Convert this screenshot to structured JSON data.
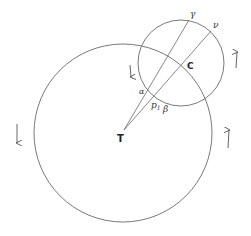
{
  "diagram": {
    "type": "geometric-figure",
    "colors": {
      "stroke": "#6a6a6a",
      "text": "#333333",
      "background": "#ffffff"
    },
    "circles": [
      {
        "name": "large-circle",
        "center_label": "T",
        "cx": 123,
        "cy": 133,
        "r": 89
      },
      {
        "name": "small-circle",
        "center_label": "C",
        "cx": 181,
        "cy": 63,
        "r": 43
      }
    ],
    "lines": [
      {
        "name": "line-T-gamma",
        "from": "T",
        "to": "γ"
      },
      {
        "name": "line-T-nu",
        "from": "T",
        "to": "ν"
      }
    ],
    "labels": {
      "T": "T",
      "C": "C",
      "gamma": "γ",
      "nu": "ν",
      "alpha": "α",
      "p1": "p",
      "p1_sub": "1",
      "beta": "β"
    },
    "arrows": [
      {
        "name": "arrow-left-down",
        "direction": "down"
      },
      {
        "name": "arrow-inner-down",
        "direction": "down"
      },
      {
        "name": "arrow-right-up",
        "direction": "up"
      },
      {
        "name": "arrow-small-right-up",
        "direction": "up"
      }
    ]
  }
}
